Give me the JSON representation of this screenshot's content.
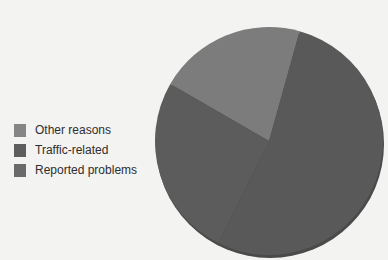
{
  "chart_data": {
    "type": "pie",
    "title": "",
    "legend_position": "left",
    "categories": [
      "Other reasons",
      "Traffic-related",
      "Reported problems"
    ],
    "values": [
      21,
      26,
      53
    ],
    "unit": "percent (estimated)",
    "colors": [
      "#7c7c7c",
      "#5c5c5c",
      "#595959"
    ]
  },
  "legend": {
    "items": [
      {
        "label": "Other reasons",
        "color": "#858585"
      },
      {
        "label": "Traffic-related",
        "color": "#5e5e5e"
      },
      {
        "label": "Reported problems",
        "color": "#6a6a6a"
      }
    ]
  }
}
